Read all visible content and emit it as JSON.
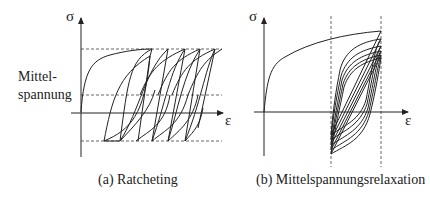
{
  "panels": [
    {
      "id": "a",
      "caption": "(a) Ratcheting",
      "y_axis_label": "σ",
      "x_axis_label": "ε",
      "side_label_line1": "Mittel-",
      "side_label_line2": "spannung"
    },
    {
      "id": "b",
      "caption": "(b) Mittelspannungsrelaxation",
      "y_axis_label": "σ",
      "x_axis_label": "ε"
    }
  ],
  "colors": {
    "line": "#222222",
    "dashed": "#555555",
    "background": "#ffffff"
  }
}
